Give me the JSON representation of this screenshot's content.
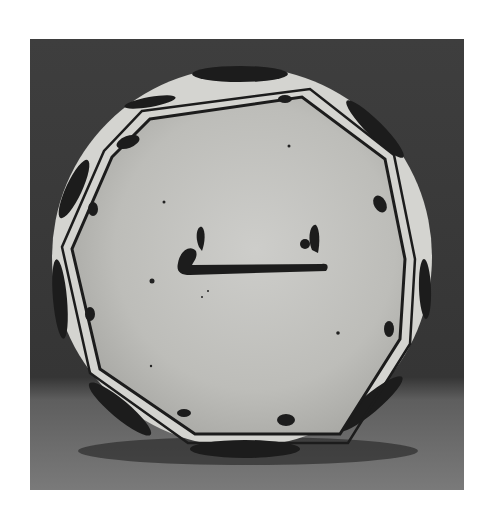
{
  "image": {
    "subject": "Ceramic plate with slip-painted decoration",
    "description": "Black-and-white photograph of a round glazed plate standing upright against a dark backdrop, with a decagonal (octagonal) painted border of dark bands and teardrop motifs, and a single calligraphic stroke in the center.",
    "colors": {
      "page_background": "#ffffff",
      "backdrop": "#3a3a3a",
      "floor": "#707070",
      "plate_glaze": "#c4c4c0",
      "plate_rim": "#d8d8d4",
      "paint": "#1c1c1c"
    }
  }
}
